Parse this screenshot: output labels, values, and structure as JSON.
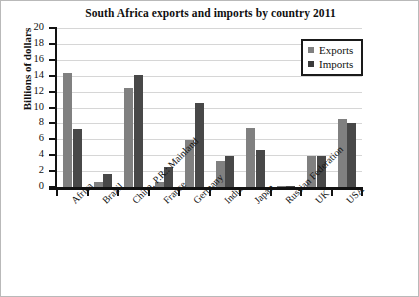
{
  "chart_data": {
    "type": "bar",
    "title": "South Africa exports and imports by country 2011",
    "xlabel": "",
    "ylabel": "Billions of dollars",
    "ylim": [
      0,
      20
    ],
    "ytick_step": 2,
    "yticks": [
      "20",
      "18",
      "16",
      "14",
      "12",
      "10",
      "8",
      "6",
      "4",
      "2",
      "0"
    ],
    "grid": true,
    "legend_position": "top-right",
    "categories": [
      "Africa",
      "Brazil",
      "China, P.R.: Mainland",
      "France",
      "Germany",
      "India",
      "Japan",
      "Russian Federation",
      "UK",
      "USA"
    ],
    "series": [
      {
        "name": "Exports",
        "color": "#808080",
        "values": [
          14.3,
          0.6,
          12.5,
          0.6,
          5.9,
          3.3,
          7.4,
          0.05,
          3.9,
          8.6
        ]
      },
      {
        "name": "Imports",
        "color": "#484848",
        "values": [
          7.3,
          1.7,
          14.1,
          2.5,
          10.6,
          3.9,
          4.6,
          0.05,
          3.9,
          8.0
        ]
      }
    ]
  },
  "legend": {
    "items": [
      {
        "label": "Exports",
        "swatch": "exports-swatch"
      },
      {
        "label": "Imports",
        "swatch": "imports-swatch"
      }
    ]
  }
}
